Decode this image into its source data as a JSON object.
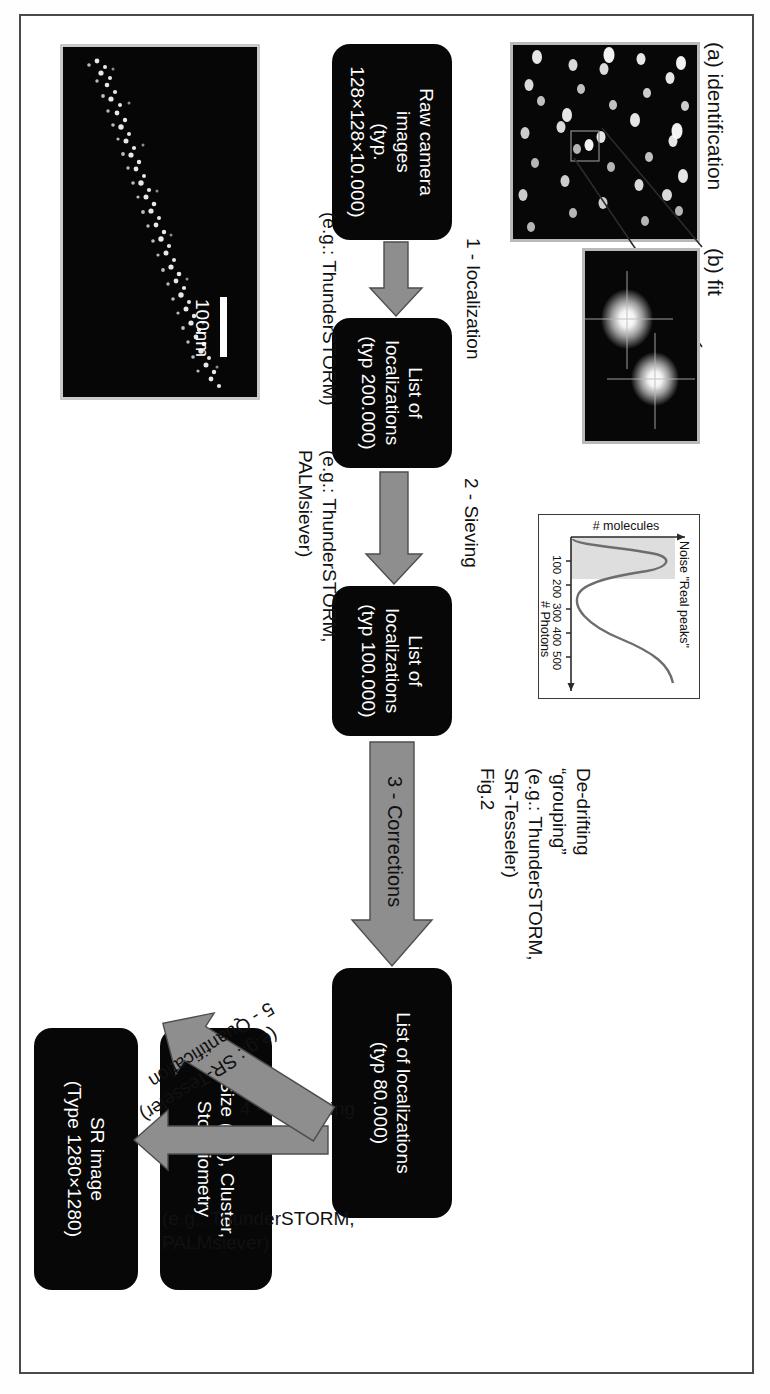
{
  "figure": {
    "frame_color": "#4a4a4a"
  },
  "panels": {
    "identification": {
      "label": "(a) identification",
      "caption": "raw camera frame with blinking single molecules"
    },
    "fit": {
      "label": "(b) fit",
      "caption": "zoomed two PSFs with fitted crosshairs"
    },
    "histogram": {
      "xlabel": "# Photons",
      "ylabel": "# molecules",
      "annotation": "Noise \"Real peaks\"",
      "xticks": [
        "100",
        "200",
        "300",
        "400",
        "500"
      ]
    },
    "sr_result": {
      "scalebar_label": "100nm"
    }
  },
  "nodes": [
    {
      "id": "raw-camera-images",
      "line1": "Raw camera",
      "line2": "images",
      "line3": "(typ. 128×128×10.000)"
    },
    {
      "id": "list-200k",
      "line1": "List of",
      "line2": "localizations",
      "line3": "(typ 200.000)"
    },
    {
      "id": "list-100k",
      "line1": "List of",
      "line2": "localizations",
      "line3": "(typ 100.000)"
    },
    {
      "id": "list-80k",
      "line1": "List of localizations",
      "line2": "(typ 80.000)",
      "line3": ""
    },
    {
      "id": "size-cluster-stoichiometry",
      "line1": "Size (nm), Cluster,",
      "line2": "Stoichiometry",
      "line3": ""
    },
    {
      "id": "sr-image",
      "line1": "SR image",
      "line2": "(Type 1280×1280)",
      "line3": ""
    }
  ],
  "arrows": [
    {
      "id": "step1",
      "label": "1 - localization",
      "note1": "(e.g.: ThunderSTORM)",
      "note2": "",
      "note3": "",
      "note4": ""
    },
    {
      "id": "step2",
      "label": "2 - Sieving",
      "note1": "(e.g.: ThunderSTORM,",
      "note2": "PALMsiever)",
      "note3": "",
      "note4": ""
    },
    {
      "id": "step3",
      "label": "3 - Corrections",
      "note1": "De-drifting",
      "note2": "“grouping”",
      "note3": "(e.g.: ThunderSTORM,",
      "note4": "SR-Tesseler)",
      "note5": "Fig.2"
    },
    {
      "id": "step4",
      "label": "4 - Rendering",
      "note1": "(e.g.: ThunderSTORM,",
      "note2": "PALMsiever)",
      "note3": "",
      "note4": ""
    },
    {
      "id": "step5",
      "label": "5 - Quantification",
      "note1": "(e.g.: SR-Tesseler)",
      "note2": "",
      "note3": "",
      "note4": ""
    }
  ],
  "colors": {
    "node_bg": "#070707",
    "node_text": "#ffffff",
    "arrow_fill": "#8e8e8e",
    "arrow_stroke": "#4d4d4d",
    "text": "#111111"
  }
}
